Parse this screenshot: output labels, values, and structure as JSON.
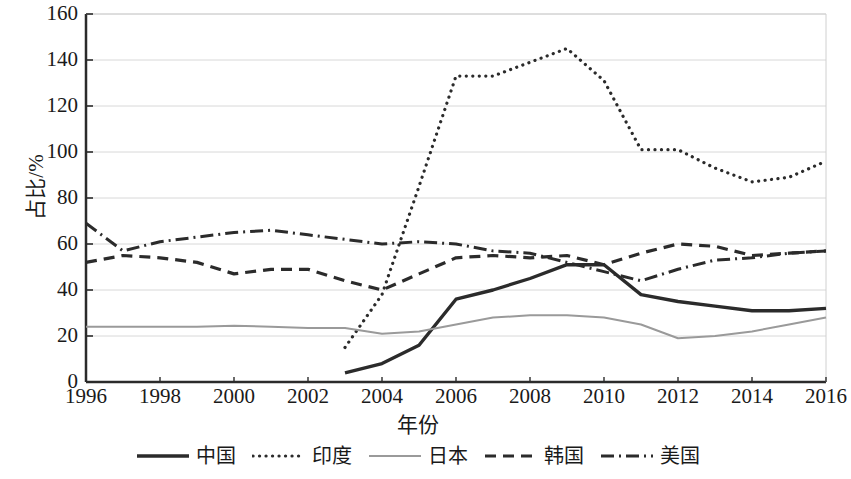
{
  "chart_data": {
    "type": "line",
    "title": "",
    "xlabel": "年份",
    "ylabel": "占比/%",
    "xlim": [
      1996,
      2016
    ],
    "ylim": [
      0,
      160
    ],
    "ytick_values": [
      0,
      20,
      40,
      60,
      80,
      100,
      120,
      140,
      160
    ],
    "ytick_labels": [
      "0",
      "20",
      "40",
      "60",
      "80",
      "100",
      "120",
      "140",
      "160"
    ],
    "xtick_values": [
      1996,
      1998,
      2000,
      2002,
      2004,
      2006,
      2008,
      2010,
      2012,
      2014,
      2016
    ],
    "xtick_labels": [
      "1996",
      "1998",
      "2000",
      "2002",
      "2004",
      "2006",
      "2008",
      "2010",
      "2012",
      "2014",
      "2016"
    ],
    "grid": "horizontal",
    "legend_position": "bottom",
    "series": [
      {
        "name": "中国",
        "style": "solid-thick",
        "color": "#2b2b2b",
        "x": [
          2003,
          2004,
          2005,
          2006,
          2007,
          2008,
          2009,
          2010,
          2011,
          2012,
          2013,
          2014,
          2015,
          2016
        ],
        "values": [
          4,
          8,
          16,
          36,
          40,
          45,
          51,
          51,
          38,
          35,
          33,
          31,
          31,
          32
        ]
      },
      {
        "name": "印度",
        "style": "dotted",
        "color": "#2b2b2b",
        "x": [
          2003,
          2004,
          2005,
          2006,
          2007,
          2008,
          2009,
          2010,
          2011,
          2012,
          2013,
          2014,
          2015,
          2016
        ],
        "values": [
          15,
          38,
          85,
          133,
          133,
          139,
          145,
          131,
          101,
          101,
          93,
          87,
          89,
          96
        ]
      },
      {
        "name": "日本",
        "style": "solid-thin",
        "color": "#9a9a9a",
        "x": [
          1996,
          1997,
          1998,
          1999,
          2000,
          2001,
          2002,
          2003,
          2004,
          2005,
          2006,
          2007,
          2008,
          2009,
          2010,
          2011,
          2012,
          2013,
          2014,
          2015,
          2016
        ],
        "values": [
          24,
          24,
          24,
          24,
          24.5,
          24,
          23.5,
          23.5,
          21,
          22,
          25,
          28,
          29,
          29,
          28,
          25,
          19,
          20,
          22,
          25,
          28
        ]
      },
      {
        "name": "韩国",
        "style": "dashed",
        "color": "#2b2b2b",
        "x": [
          1996,
          1997,
          1998,
          1999,
          2000,
          2001,
          2002,
          2003,
          2004,
          2005,
          2006,
          2007,
          2008,
          2009,
          2010,
          2011,
          2012,
          2013,
          2014,
          2015,
          2016
        ],
        "values": [
          52,
          55,
          54,
          52,
          47,
          49,
          49,
          44,
          40,
          47,
          54,
          55,
          54,
          55,
          51,
          56,
          60,
          59,
          55,
          56,
          57
        ]
      },
      {
        "name": "美国",
        "style": "dash-dot",
        "color": "#2b2b2b",
        "x": [
          1996,
          1997,
          1998,
          1999,
          2000,
          2001,
          2002,
          2003,
          2004,
          2005,
          2006,
          2007,
          2008,
          2009,
          2010,
          2011,
          2012,
          2013,
          2014,
          2015,
          2016
        ],
        "values": [
          69,
          57,
          61,
          63,
          65,
          66,
          64,
          62,
          60,
          61,
          60,
          57,
          56,
          52,
          48,
          44,
          49,
          53,
          54,
          56,
          57
        ]
      }
    ]
  },
  "legend": {
    "items": [
      {
        "label": "中国"
      },
      {
        "label": "印度"
      },
      {
        "label": "日本"
      },
      {
        "label": "韩国"
      },
      {
        "label": "美国"
      }
    ]
  }
}
